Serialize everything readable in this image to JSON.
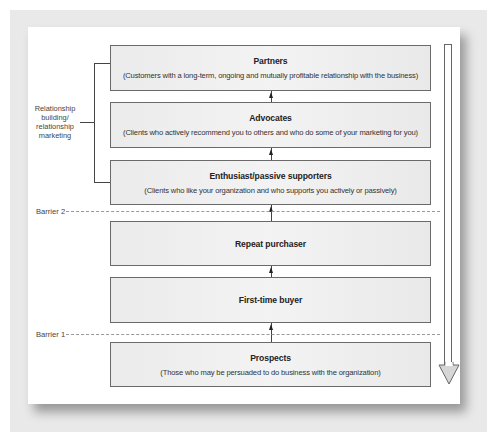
{
  "diagram": {
    "type": "ladder",
    "stages": [
      {
        "id": "partners",
        "title": "Partners",
        "description": "(Customers with a long-term, ongoing and mutually profitable relationship with the business)"
      },
      {
        "id": "advocates",
        "title": "Advocates",
        "description": "(Clients who actively recommend you to others and who do some of your marketing for you)"
      },
      {
        "id": "enthusiast",
        "title": "Enthusiast/passive supporters",
        "description": "(Clients who like your organization and who supports you actively or passively)"
      },
      {
        "id": "repeat",
        "title": "Repeat purchaser",
        "description": ""
      },
      {
        "id": "first-time",
        "title": "First-time buyer",
        "description": ""
      },
      {
        "id": "prospects",
        "title": "Prospects",
        "description": "(Those who may be persuaded to do business with the organization)"
      }
    ],
    "barriers": [
      {
        "label": "Barrier 2"
      },
      {
        "label": "Barrier 1"
      }
    ],
    "bracket_label": "Relationship building/ relationship marketing",
    "colors": {
      "box_fill": "#efefef",
      "box_border": "#6a6a6a",
      "background": "#e9e9e9",
      "panel": "#ffffff"
    }
  }
}
